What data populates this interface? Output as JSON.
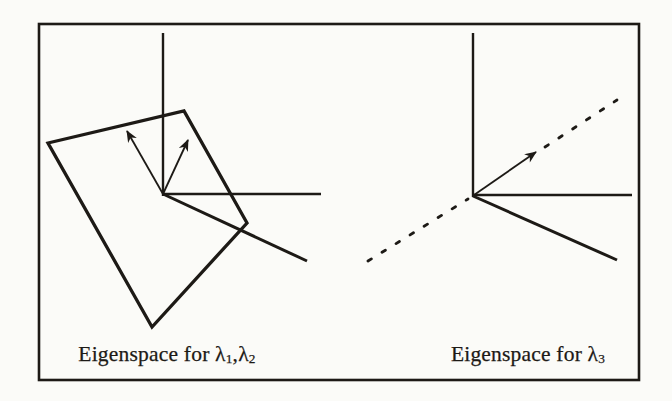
{
  "figure": {
    "type": "textbook-diagram",
    "panels": [
      {
        "id": "left",
        "caption": {
          "prefix": "Eigenspace for ",
          "lambda1": "λ",
          "sub1": "1",
          "separator": ",",
          "lambda2": "λ",
          "sub2": "2"
        }
      },
      {
        "id": "right",
        "caption": {
          "prefix": "Eigenspace for ",
          "lambda1": "λ",
          "sub1": "3"
        }
      }
    ]
  },
  "colors": {
    "ink": "#1d1a16",
    "paper": "#fbfbf8"
  },
  "geometry": {
    "canvas": {
      "width": 672,
      "height": 401
    },
    "border": {
      "x": 39,
      "y": 24,
      "width": 600,
      "height": 356,
      "stroke_width": 2.6
    },
    "axes": [
      {
        "name": "left-panel-vertical-axis",
        "x1": 163,
        "y1": 33,
        "x2": 163,
        "y2": 196,
        "stroke_width": 2.4
      },
      {
        "name": "left-panel-horizontal-axis",
        "x1": 163,
        "y1": 194,
        "x2": 321,
        "y2": 194,
        "stroke_width": 2.4
      },
      {
        "name": "left-panel-depth-axis",
        "x1": 163,
        "y1": 194,
        "x2": 307,
        "y2": 261,
        "stroke_width": 3.0
      },
      {
        "name": "right-panel-vertical-axis",
        "x1": 473,
        "y1": 33,
        "x2": 473,
        "y2": 197,
        "stroke_width": 2.4
      },
      {
        "name": "right-panel-horizontal-axis",
        "x1": 473,
        "y1": 195,
        "x2": 632,
        "y2": 195,
        "stroke_width": 2.4
      },
      {
        "name": "right-panel-depth-axis",
        "x1": 473,
        "y1": 196,
        "x2": 617,
        "y2": 260,
        "stroke_width": 3.0
      }
    ],
    "plane": {
      "name": "eigenplane-parallelogram",
      "points": [
        [
          48,
          143
        ],
        [
          184,
          111
        ],
        [
          247,
          223
        ],
        [
          152,
          327
        ]
      ],
      "stroke_width": 3.3
    },
    "dashed_lines": [
      {
        "name": "eigenline-dashed-lower",
        "x1": 368,
        "y1": 261,
        "x2": 468,
        "y2": 199,
        "stroke_width": 2.8,
        "dash": "4 12.5"
      },
      {
        "name": "eigenline-dashed-upper",
        "x1": 545,
        "y1": 147,
        "x2": 617,
        "y2": 100,
        "stroke_width": 2.8,
        "dash": "4 12.5"
      }
    ],
    "arrows": [
      {
        "name": "eigenvector-arrow-1",
        "x1": 163,
        "y1": 194,
        "x2": 127,
        "y2": 131,
        "stroke_width": 1.8
      },
      {
        "name": "eigenvector-arrow-2",
        "x1": 163,
        "y1": 194,
        "x2": 188,
        "y2": 140,
        "stroke_width": 1.8
      },
      {
        "name": "eigenvector-arrow-3",
        "x1": 474,
        "y1": 195,
        "x2": 536,
        "y2": 152,
        "stroke_width": 1.8
      }
    ]
  }
}
